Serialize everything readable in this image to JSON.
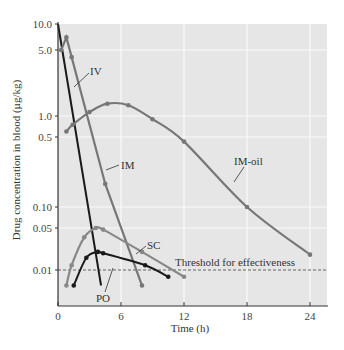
{
  "chart_data": {
    "type": "line",
    "title": "",
    "xlabel": "Time (h)",
    "ylabel": "Drug concentration in blood (µg/kg)",
    "yscale": "log",
    "xlim": [
      0,
      25.5
    ],
    "ylim": [
      0.004,
      10.0
    ],
    "x_ticks": [
      0,
      6,
      12,
      18,
      24
    ],
    "y_ticks": [
      {
        "value": 10.0,
        "label": "10.0"
      },
      {
        "value": 5.0,
        "label": "5.0"
      },
      {
        "value": 1.0,
        "label": "1.0"
      },
      {
        "value": 0.5,
        "label": "0.5"
      },
      {
        "value": 0.1,
        "label": "0.10"
      },
      {
        "value": 0.05,
        "label": "0.05"
      },
      {
        "value": 0.01,
        "label": "0.01"
      }
    ],
    "grid": true,
    "threshold": {
      "value": 0.01,
      "label": "Threshold for effectiveness"
    },
    "series": [
      {
        "name": "IV",
        "color": "#1a1a1a",
        "markers": false,
        "points": [
          [
            0,
            10.0
          ],
          [
            4.1,
            0.006
          ]
        ]
      },
      {
        "name": "IM",
        "color": "#777777",
        "markers": true,
        "points": [
          [
            0.3,
            5.0
          ],
          [
            0.8,
            7.0
          ],
          [
            1.3,
            4.2
          ],
          [
            4.5,
            0.17
          ],
          [
            8.0,
            0.006
          ]
        ]
      },
      {
        "name": "IM-oil",
        "color": "#777777",
        "markers": true,
        "points": [
          [
            0.8,
            0.6
          ],
          [
            1.4,
            0.75
          ],
          [
            3.0,
            1.1
          ],
          [
            4.7,
            1.35
          ],
          [
            6.7,
            1.3
          ],
          [
            9.0,
            0.9
          ],
          [
            12.0,
            0.45
          ],
          [
            18.0,
            0.1
          ],
          [
            24.0,
            0.018
          ]
        ]
      },
      {
        "name": "SC",
        "color": "#888888",
        "markers": true,
        "points": [
          [
            0.8,
            0.006
          ],
          [
            1.3,
            0.012
          ],
          [
            2.5,
            0.035
          ],
          [
            3.6,
            0.05
          ],
          [
            4.3,
            0.047
          ],
          [
            8.0,
            0.02
          ],
          [
            12.0,
            0.008
          ]
        ]
      },
      {
        "name": "PO",
        "color": "#1a1a1a",
        "markers": true,
        "points": [
          [
            1.5,
            0.006
          ],
          [
            2.7,
            0.016
          ],
          [
            3.8,
            0.02
          ],
          [
            4.3,
            0.019
          ],
          [
            8.3,
            0.012
          ],
          [
            10.5,
            0.008
          ]
        ]
      }
    ],
    "annotations": [
      {
        "text": "IV",
        "x": 2.8,
        "y": 3.0
      },
      {
        "text": "IM",
        "x": 5.7,
        "y": 0.3
      },
      {
        "text": "IM-oil",
        "x": 15.5,
        "y": 0.33
      },
      {
        "text": "SC",
        "x": 8.5,
        "y": 0.03
      },
      {
        "text": "PO",
        "x": 4.0,
        "y": 0.0055
      },
      {
        "text": "Threshold for effectiveness",
        "x": 15.2,
        "y": 0.011
      }
    ]
  },
  "labels": {
    "xlabel": "Time (h)",
    "ylabel": "Drug concentration in blood (µg/kg)",
    "threshold": "Threshold for effectiveness",
    "IV": "IV",
    "IM": "IM",
    "IM_oil": "IM-oil",
    "SC": "SC",
    "PO": "PO"
  }
}
